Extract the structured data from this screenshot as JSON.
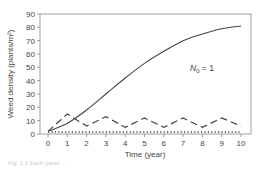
{
  "chart_data": {
    "type": "line",
    "title": "",
    "xlabel": "Time (year)",
    "ylabel": "Weed density (plants/m²)",
    "xlim": [
      0,
      10
    ],
    "ylim": [
      0,
      90
    ],
    "x_ticks": [
      "0",
      "1",
      "2",
      "3",
      "4",
      "5",
      "6",
      "7",
      "8",
      "9",
      "10"
    ],
    "y_ticks": [
      "0",
      "10",
      "20",
      "30",
      "40",
      "50",
      "60",
      "70",
      "80",
      "90"
    ],
    "grid": false,
    "legend": null,
    "annotations": [
      {
        "text_main": "N",
        "text_sub": "0",
        "text_rest": " = 1",
        "x": 7.6,
        "y": 48
      }
    ],
    "x": [
      0,
      1,
      2,
      3,
      4,
      5,
      6,
      7,
      8,
      9,
      10
    ],
    "series": [
      {
        "name": "solid",
        "style": "solid",
        "values": [
          2,
          8,
          18,
          30,
          42,
          53,
          62,
          70,
          75,
          79,
          81
        ]
      },
      {
        "name": "dashed",
        "style": "dashed",
        "values": [
          2,
          15,
          6,
          13,
          5,
          12,
          5,
          12,
          5,
          12,
          6
        ]
      },
      {
        "name": "dotted",
        "style": "dotted",
        "values": [
          1.5,
          1.5,
          1.5,
          1.5,
          1.5,
          1.5,
          1.5,
          1.5,
          1.5,
          1.5,
          1.5
        ]
      }
    ]
  },
  "labels": {
    "xlabel": "Time (year)",
    "ylabel": "Weed density (plants/m²)",
    "annot_main": "N",
    "annot_sub": "0",
    "annot_rest": " = 1",
    "caption": "Fig. 1.1  Each panel ..."
  }
}
